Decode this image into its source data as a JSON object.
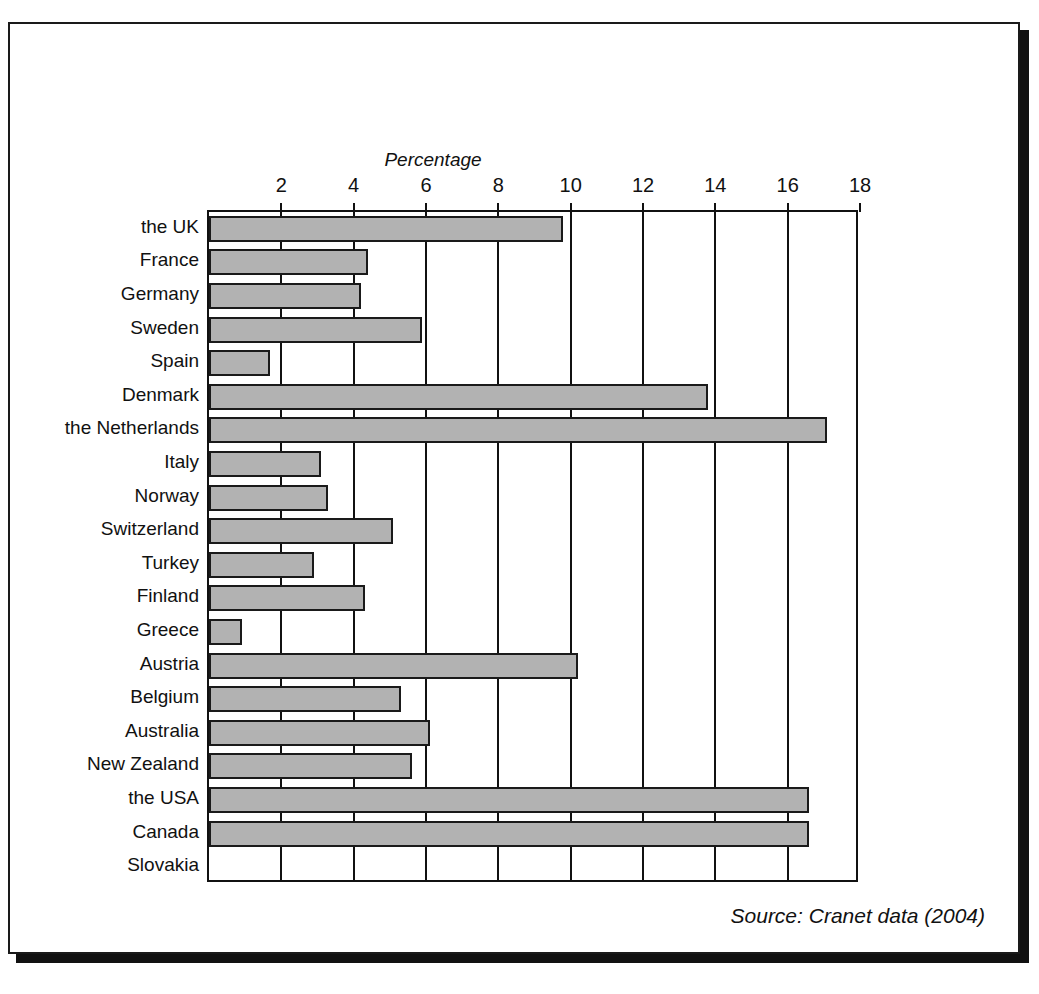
{
  "page": {
    "top_cropped_fragment": ", ,",
    "source_note": "Source: Cranet data (2004)"
  },
  "chart_data": {
    "type": "bar",
    "orientation": "horizontal",
    "title": "",
    "xlabel": "Percentage",
    "ylabel": "",
    "axis_title": "Percentage",
    "xlim": [
      0,
      18
    ],
    "xticks": [
      2,
      4,
      6,
      8,
      10,
      12,
      14,
      16,
      18
    ],
    "xtick_labels": [
      "2",
      "4",
      "6",
      "8",
      "10",
      "12",
      "14",
      "16",
      "18"
    ],
    "grid": "vertical",
    "legend": "none",
    "bar_fill_color": "#b2b2b2",
    "bar_edge_color": "#1a1a1a",
    "categories": [
      "the UK",
      "France",
      "Germany",
      "Sweden",
      "Spain",
      "Denmark",
      "the Netherlands",
      "Italy",
      "Norway",
      "Switzerland",
      "Turkey",
      "Finland",
      "Greece",
      "Austria",
      "Belgium",
      "Australia",
      "New Zealand",
      "the USA",
      "Canada",
      "Slovakia"
    ],
    "values": [
      9.8,
      4.4,
      4.2,
      5.9,
      1.7,
      13.8,
      17.1,
      3.1,
      3.3,
      5.1,
      2.9,
      4.3,
      0.9,
      10.2,
      5.3,
      6.1,
      5.6,
      16.6,
      16.6,
      0
    ]
  }
}
